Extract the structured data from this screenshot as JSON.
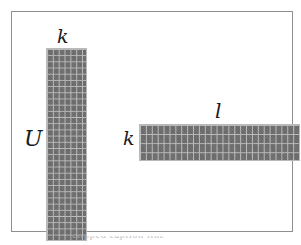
{
  "figure": {
    "background_color": "#ffffff",
    "frame": {
      "border_color": "#8e8e8e",
      "fill_color": "#ffffff"
    },
    "cell_color": "#6d6d6d",
    "gridline_color": "#bdbdbd",
    "label_color": "#1a1a1a"
  },
  "labels": {
    "k_top": "k",
    "u_left": "U",
    "k_left": "k",
    "l_top": "l"
  },
  "caption": {
    "text": "clipped caption line"
  },
  "chart_data": {
    "type": "diagram",
    "title": "",
    "blocks": [
      {
        "name": "U",
        "orientation": "vertical",
        "label_left": "U",
        "label_top": "k",
        "columns": 7,
        "rows": 31,
        "x": 34,
        "y": 36,
        "width": 41,
        "height": 193
      },
      {
        "name": "V",
        "orientation": "horizontal",
        "label_left": "k",
        "label_top": "l",
        "columns": 27,
        "rows": 4,
        "x": 127,
        "y": 112,
        "width": 161,
        "height": 37
      }
    ],
    "annotations": [
      "k",
      "U",
      "k",
      "l"
    ],
    "grid": true,
    "legend": "none"
  }
}
